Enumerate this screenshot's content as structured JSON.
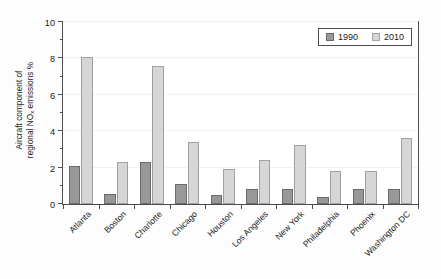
{
  "chart_data": {
    "type": "bar",
    "title": "",
    "xlabel": "",
    "ylabel_line1": "Aircraft component of",
    "ylabel_line2_pre": "regional NO",
    "ylabel_line2_sub": "x",
    "ylabel_line2_post": " emissions %",
    "ylim": [
      0,
      10
    ],
    "yticks": [
      0,
      2,
      4,
      6,
      8,
      10
    ],
    "ytick_labels": [
      "0",
      "2",
      "4",
      "6",
      "8",
      "10"
    ],
    "yminor_ticks": [
      1,
      3,
      5,
      7,
      9
    ],
    "grid": "horizontal-faint",
    "legend_position": "upper-right",
    "categories": [
      "Atlanta",
      "Boston",
      "Charlotte",
      "Chicago",
      "Houston",
      "Los Angeles",
      "New York",
      "Philadelphia",
      "Phoenix",
      "Washington DC"
    ],
    "series": [
      {
        "name": "1990",
        "color": "#989898",
        "values": [
          2.1,
          0.55,
          2.3,
          1.1,
          0.5,
          0.85,
          0.85,
          0.4,
          0.85,
          0.85
        ]
      },
      {
        "name": "2010",
        "color": "#d6d6d6",
        "values": [
          8.1,
          2.3,
          7.6,
          3.4,
          1.9,
          2.4,
          3.25,
          1.8,
          1.8,
          3.65
        ]
      }
    ]
  }
}
